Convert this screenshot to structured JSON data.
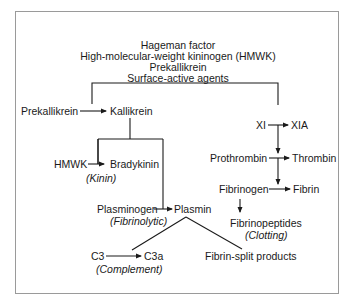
{
  "header": {
    "lines": [
      "Hageman factor",
      "High-molecular-weight kininogen (HMWK)",
      "Prekallikrein",
      "Surface-active agents"
    ]
  },
  "nodes": {
    "prekallikrein": "Prekallikrein",
    "kallikrein": "Kallikrein",
    "xi": "XI",
    "xia": "XIA",
    "hmwk": "HMWK",
    "bradykinin": "Bradykinin",
    "kinin_label": "(Kinin)",
    "prothrombin": "Prothrombin",
    "thrombin": "Thrombin",
    "fibrinogen": "Fibrinogen",
    "fibrin": "Fibrin",
    "fibrinopeptides": "Fibrinopeptides",
    "clotting_label": "(Clotting)",
    "plasminogen": "Plasminogen",
    "fibrinolytic_label": "(Fibrinolytic)",
    "plasmin": "Plasmin",
    "c3": "C3",
    "c3a": "C3a",
    "complement_label": "(Complement)",
    "fibrin_split": "Fibrin-split products"
  },
  "colors": {
    "line": "#1a1a1a",
    "border": "#9a9a9a"
  }
}
